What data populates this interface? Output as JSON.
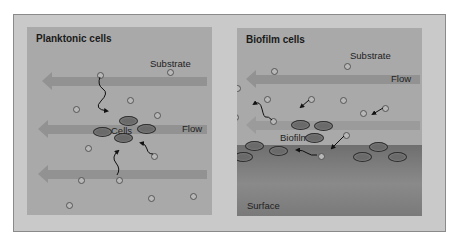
{
  "panels": {
    "left": {
      "title": "Planktonic cells",
      "substrate_label": "Substrate",
      "cells_label": "Cells",
      "flow_label": "Flow"
    },
    "right": {
      "title": "Biofilm cells",
      "substrate_label": "Substrate",
      "flow_label": "Flow",
      "biofilm_label": "Biofilm",
      "surface_label": "Surface"
    }
  },
  "colors": {
    "frame": "#c9c9c9",
    "panel": "#a9a9a9",
    "cell": "#6a6a6a",
    "surface": "#7a7a7a"
  }
}
